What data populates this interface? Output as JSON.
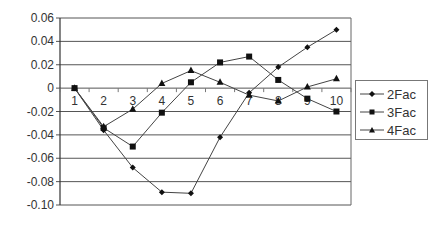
{
  "chart_data": {
    "type": "line",
    "title": "",
    "xlabel": "",
    "ylabel": "",
    "x": [
      1,
      2,
      3,
      4,
      5,
      6,
      7,
      8,
      9,
      10
    ],
    "ylim": [
      -0.1,
      0.06
    ],
    "yticks": [
      0.06,
      0.04,
      0.02,
      0,
      -0.02,
      -0.04,
      -0.06,
      -0.08,
      -0.1
    ],
    "ytick_labels": [
      "0.06",
      "0.04",
      "0.02",
      "0",
      "-0.02",
      "-0.04",
      "-0.06",
      "-0.08",
      "-0.10"
    ],
    "xtick_labels": [
      "1",
      "2",
      "3",
      "4",
      "5",
      "6",
      "7",
      "8",
      "9",
      "10"
    ],
    "grid": true,
    "legend_position": "right",
    "series": [
      {
        "name": "2Fac",
        "marker": "diamond",
        "values": [
          0.0,
          -0.036,
          -0.068,
          -0.089,
          -0.09,
          -0.042,
          -0.004,
          0.018,
          0.035,
          0.05
        ]
      },
      {
        "name": "3Fac",
        "marker": "square",
        "values": [
          0.0,
          -0.034,
          -0.05,
          -0.021,
          0.005,
          0.022,
          0.027,
          0.007,
          -0.009,
          -0.02
        ]
      },
      {
        "name": "4Fac",
        "marker": "triangle",
        "values": [
          0.0,
          -0.033,
          -0.018,
          0.004,
          0.015,
          0.005,
          -0.006,
          -0.011,
          0.001,
          0.008
        ]
      }
    ]
  },
  "legend": {
    "items": [
      {
        "label": "2Fac"
      },
      {
        "label": "3Fac"
      },
      {
        "label": "4Fac"
      }
    ]
  }
}
